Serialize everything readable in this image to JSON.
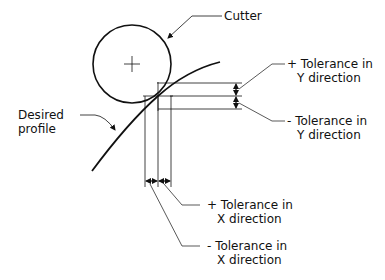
{
  "diagram": {
    "labels": {
      "cutter": "Cutter",
      "desired_profile_line1": "Desired",
      "desired_profile_line2": "profile",
      "plus_y_line1": "+ Tolerance in",
      "plus_y_line2": "Y direction",
      "minus_y_line1": "- Tolerance in",
      "minus_y_line2": "Y direction",
      "plus_x_line1": "+ Tolerance in",
      "plus_x_line2": "X direction",
      "minus_x_line1": "- Tolerance in",
      "minus_x_line2": "X direction"
    },
    "colors": {
      "ink": "#111111",
      "background": "#ffffff"
    }
  }
}
